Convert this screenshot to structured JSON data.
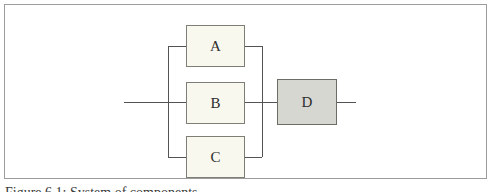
{
  "figure": {
    "caption": "Figure 6.1: System of components",
    "diagram": {
      "type": "reliability-block-diagram",
      "blocks": [
        {
          "label": "A",
          "group": "parallel",
          "fill": "#f8f8ef",
          "border": "#7e7e76"
        },
        {
          "label": "B",
          "group": "parallel",
          "fill": "#f8f8ef",
          "border": "#7e7e76"
        },
        {
          "label": "C",
          "group": "parallel",
          "fill": "#f8f8ef",
          "border": "#7e7e76"
        },
        {
          "label": "D",
          "group": "series",
          "fill": "#d7d7d2",
          "border": "#6d6d66"
        }
      ],
      "structure": "A, B, C in parallel; that group in series with D",
      "line_color": "#545454",
      "frame_border_color": "#9c9c9c",
      "background_color": "#ffffff"
    }
  }
}
